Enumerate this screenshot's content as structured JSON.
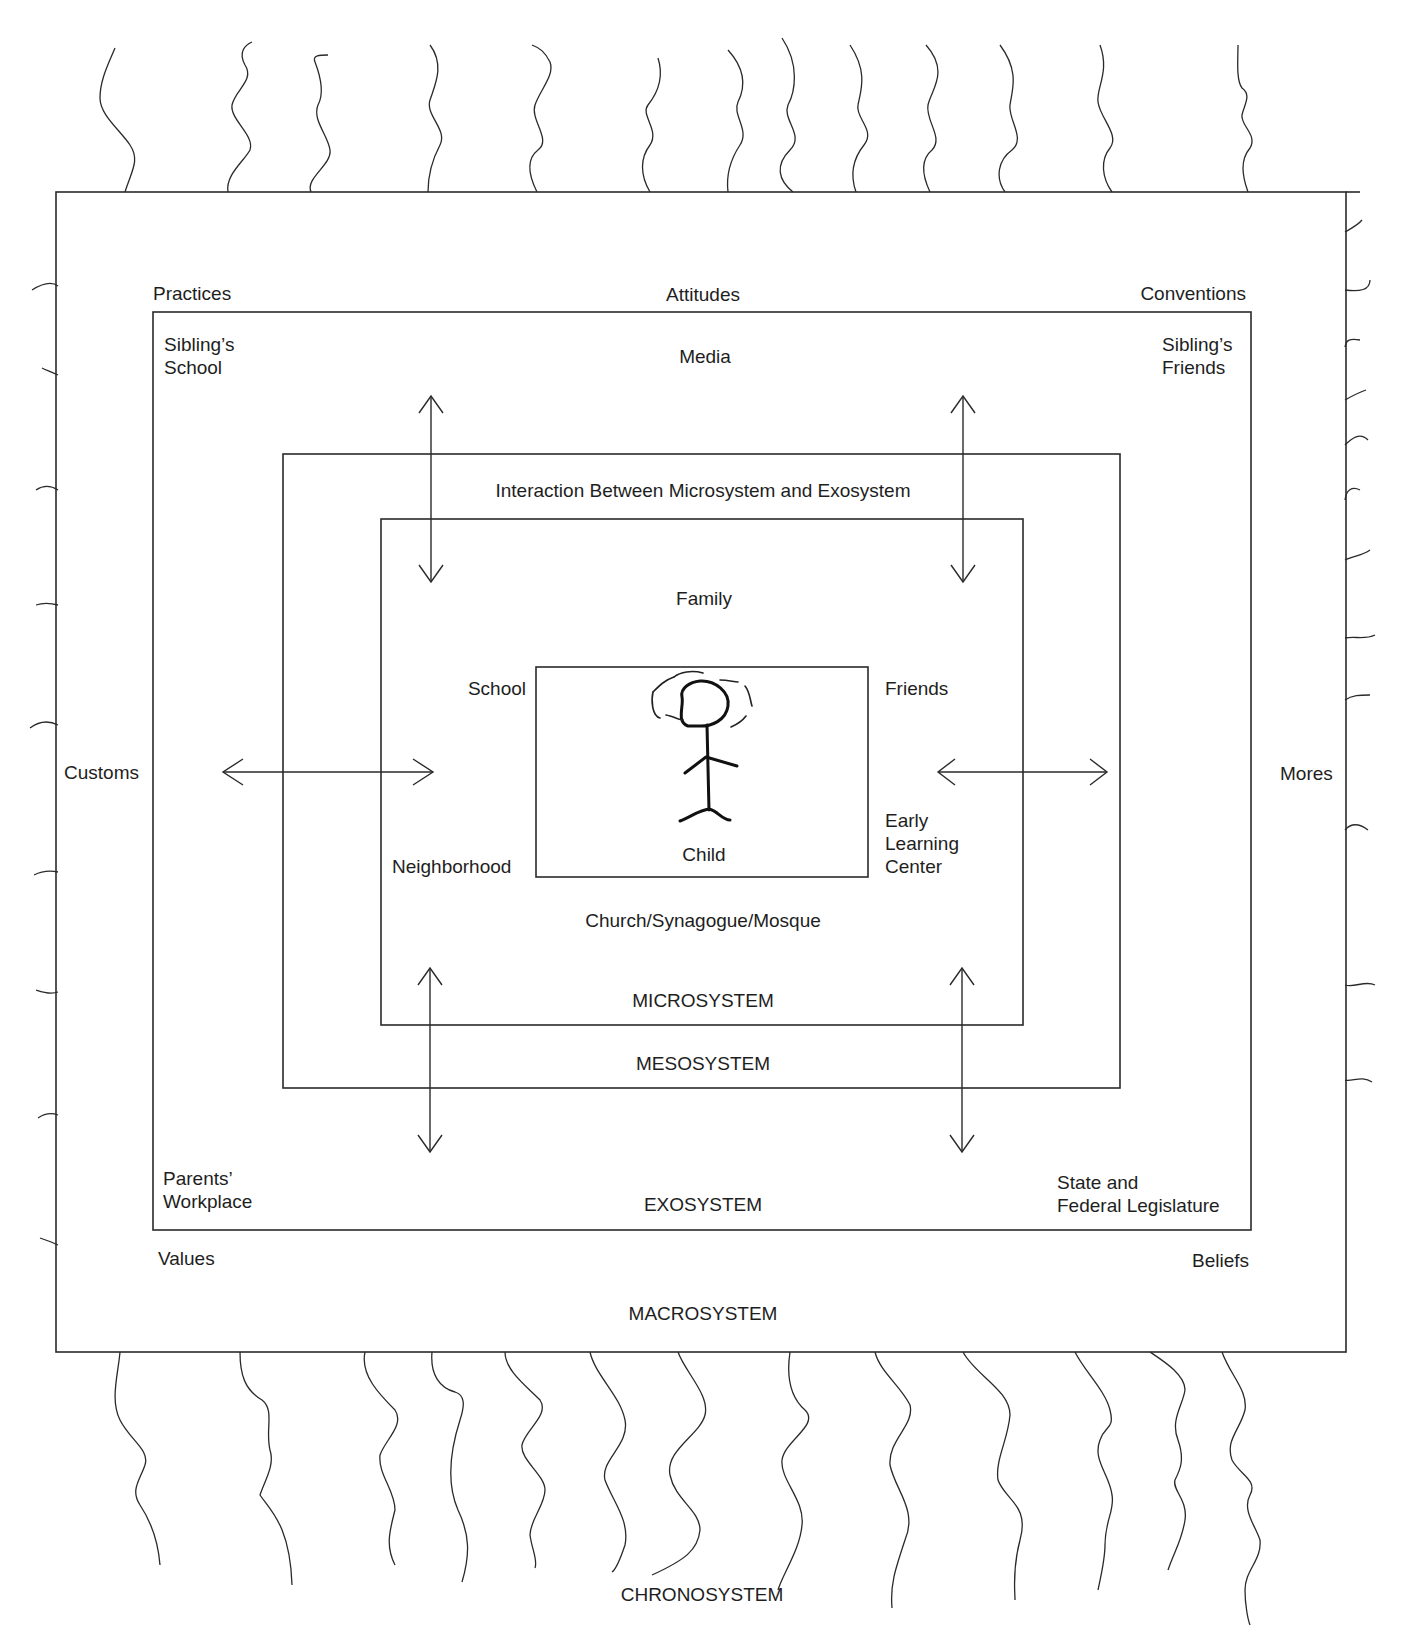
{
  "diagram": {
    "type": "nested-systems",
    "colors": {
      "stroke": "#2a2a2a",
      "text": "#1e1e1e",
      "background": "#ffffff"
    },
    "chronosystem": {
      "label": "CHRONOSYSTEM"
    },
    "macrosystem": {
      "label": "MACROSYSTEM",
      "items": {
        "practices": "Practices",
        "attitudes": "Attitudes",
        "conventions": "Conventions",
        "customs": "Customs",
        "mores": "Mores",
        "values": "Values",
        "beliefs": "Beliefs"
      }
    },
    "exosystem": {
      "label": "EXOSYSTEM",
      "items": {
        "siblings_school_line1": "Sibling’s",
        "siblings_school_line2": "School",
        "media": "Media",
        "siblings_friends_line1": "Sibling’s",
        "siblings_friends_line2": "Friends",
        "parents_workplace_line1": "Parents’",
        "parents_workplace_line2": "Workplace",
        "legislature_line1": "State and",
        "legislature_line2": "Federal Legislature"
      }
    },
    "mesosystem": {
      "label": "MESOSYSTEM",
      "description": "Interaction Between Microsystem and Exosystem"
    },
    "microsystem": {
      "label": "MICROSYSTEM",
      "items": {
        "family": "Family",
        "school": "School",
        "friends": "Friends",
        "neighborhood": "Neighborhood",
        "early_learning_line1": "Early",
        "early_learning_line2": "Learning",
        "early_learning_line3": "Center",
        "church": "Church/Synagogue/Mosque"
      }
    },
    "child": {
      "label": "Child",
      "icon": "stick-figure-icon"
    },
    "arrows": [
      {
        "id": "top-left-vertical",
        "direction": "both"
      },
      {
        "id": "top-right-vertical",
        "direction": "both"
      },
      {
        "id": "bottom-left-vertical",
        "direction": "both"
      },
      {
        "id": "bottom-right-vertical",
        "direction": "both"
      },
      {
        "id": "left-horizontal",
        "direction": "both"
      },
      {
        "id": "right-horizontal",
        "direction": "both"
      }
    ]
  }
}
